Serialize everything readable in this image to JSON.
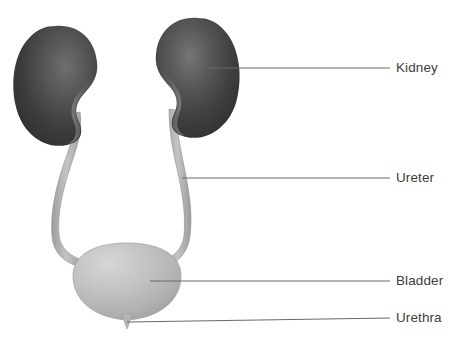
{
  "diagram": {
    "background_color": "#ffffff",
    "label_color": "#3d3d3d",
    "leader_line_color": "#6a6a6a",
    "labels": [
      {
        "id": "kidney",
        "text": "Kidney",
        "x": 396,
        "y": 61
      },
      {
        "id": "ureter",
        "text": "Ureter",
        "x": 396,
        "y": 171
      },
      {
        "id": "bladder",
        "text": "Bladder",
        "x": 396,
        "y": 274
      },
      {
        "id": "urethra",
        "text": "Urethra",
        "x": 396,
        "y": 311
      }
    ],
    "leader_lines": [
      {
        "id": "kidney-leader",
        "x1": 208,
        "y1": 68,
        "x2": 390,
        "y2": 68
      },
      {
        "id": "ureter-leader",
        "x1": 182,
        "y1": 178,
        "x2": 390,
        "y2": 178
      },
      {
        "id": "bladder-leader",
        "x1": 150,
        "y1": 281,
        "x2": 390,
        "y2": 281
      },
      {
        "id": "urethra-leader",
        "x1": 127,
        "y1": 322,
        "x2": 390,
        "y2": 318
      }
    ],
    "structures": [
      {
        "id": "kidney-left",
        "name": "Kidney",
        "side": "left",
        "fill_dark": "#2f2f2f",
        "fill_light": "#6e6e6e",
        "center_x": 57,
        "center_y": 86
      },
      {
        "id": "kidney-right",
        "name": "Kidney",
        "side": "right",
        "fill_dark": "#2f2f2f",
        "fill_light": "#6e6e6e",
        "center_x": 196,
        "center_y": 78
      },
      {
        "id": "ureter-left",
        "name": "Ureter",
        "side": "left",
        "fill": "#b0b0b0"
      },
      {
        "id": "ureter-right",
        "name": "Ureter",
        "side": "right",
        "fill": "#b0b0b0"
      },
      {
        "id": "bladder",
        "name": "Bladder",
        "fill_light": "#cfcfcf",
        "fill_dark": "#a3a3a3",
        "center_x": 127,
        "center_y": 279
      },
      {
        "id": "urethra",
        "name": "Urethra",
        "fill": "#b0b0b0",
        "x": 127,
        "y": 320
      }
    ]
  }
}
